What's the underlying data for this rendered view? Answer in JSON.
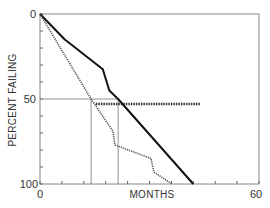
{
  "chart_data": {
    "type": "line",
    "title": "",
    "xlabel": "MONTHS",
    "ylabel": "PERCENT FAILING",
    "xlim": [
      0,
      60
    ],
    "ylim": [
      0,
      100
    ],
    "y_inverted": true,
    "x_ticks": {
      "labeled": [
        0,
        60
      ],
      "minor_step": 6
    },
    "y_ticks": {
      "labeled": [
        0,
        50,
        100
      ],
      "minor_step": 10
    },
    "x_tick_labels": [
      "0",
      "60"
    ],
    "y_tick_labels": [
      "0",
      "50",
      "100"
    ],
    "grid": false,
    "legend": null,
    "series": [
      {
        "name": "solid-curve",
        "style": "solid",
        "color": "#111111",
        "points": [
          [
            0,
            0
          ],
          [
            6.8,
            15
          ],
          [
            17.2,
            32.5
          ],
          [
            19,
            45
          ],
          [
            21.4,
            50
          ],
          [
            42,
            100
          ]
        ]
      },
      {
        "name": "dotted-curve",
        "style": "dotted",
        "color": "#555555",
        "points": [
          [
            0,
            0
          ],
          [
            14,
            50
          ],
          [
            20,
            69
          ],
          [
            20.5,
            77
          ],
          [
            30.4,
            85
          ],
          [
            31.2,
            93
          ],
          [
            36.2,
            100
          ]
        ]
      }
    ],
    "annotations": [
      {
        "type": "hline",
        "y": 50,
        "x_from": 0,
        "x_to": 21.4,
        "style": "thin-solid",
        "label": "50% reference"
      },
      {
        "type": "vline",
        "x": 14,
        "y_from": 50,
        "y_to": 100,
        "style": "thin-solid",
        "label": "median dotted"
      },
      {
        "type": "vline",
        "x": 21.4,
        "y_from": 50,
        "y_to": 100,
        "style": "thin-solid",
        "label": "median solid"
      },
      {
        "type": "hline",
        "y": 53,
        "x_from": 15.3,
        "x_to": 43.8,
        "style": "thick-dotted",
        "label": "difference bar"
      }
    ]
  },
  "axes": {
    "x_label": "MONTHS",
    "y_label": "PERCENT FAILING",
    "x_tick_0": "0",
    "x_tick_60": "60",
    "y_tick_0": "0",
    "y_tick_50": "50",
    "y_tick_100": "100"
  }
}
